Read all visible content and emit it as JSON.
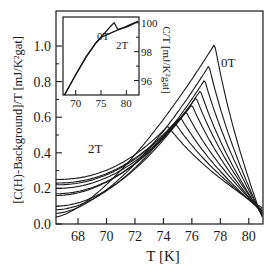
{
  "chart_data": [
    {
      "type": "line",
      "title": "",
      "xlabel": "T [K]",
      "ylabel": "[C(H)-Background]/T [mJ/K²gat]",
      "xlim": [
        66.45,
        81.0
      ],
      "ylim": [
        0.0,
        1.15
      ],
      "x_ticks": [
        68,
        70,
        72,
        74,
        76,
        78,
        80
      ],
      "y_ticks": [
        0.0,
        0.2,
        0.4,
        0.6,
        0.8,
        1.0
      ],
      "x_tick_labels": [
        "68",
        "70",
        "72",
        "74",
        "76",
        "78",
        "80"
      ],
      "y_tick_labels": [
        "0.0",
        "0.2",
        "0.4",
        "0.6",
        "0.8",
        "1.0"
      ],
      "grid": false,
      "legend": "none",
      "annotations": [
        {
          "text": "0T",
          "x": 78.2,
          "y": 0.9
        },
        {
          "text": "2T",
          "x": 68.8,
          "y": 0.42
        }
      ],
      "series": [
        {
          "name": "0T",
          "start": 0.04,
          "peak_T": 77.6,
          "peak": 1.01,
          "end": 0.03
        },
        {
          "name": "H2",
          "start": 0.06,
          "peak_T": 77.2,
          "peak": 0.89,
          "end": 0.04
        },
        {
          "name": "H3",
          "start": 0.08,
          "peak_T": 76.9,
          "peak": 0.81,
          "end": 0.05
        },
        {
          "name": "H4",
          "start": 0.1,
          "peak_T": 76.6,
          "peak": 0.75,
          "end": 0.05
        },
        {
          "name": "H5",
          "start": 0.16,
          "peak_T": 76.3,
          "peak": 0.71,
          "end": 0.06
        },
        {
          "name": "H6",
          "start": 0.17,
          "peak_T": 76.0,
          "peak": 0.67,
          "end": 0.06
        },
        {
          "name": "H7",
          "start": 0.2,
          "peak_T": 75.6,
          "peak": 0.63,
          "end": 0.07
        },
        {
          "name": "H8",
          "start": 0.22,
          "peak_T": 75.2,
          "peak": 0.6,
          "end": 0.07
        },
        {
          "name": "H9",
          "start": 0.23,
          "peak_T": 74.8,
          "peak": 0.57,
          "end": 0.08
        },
        {
          "name": "2T",
          "start": 0.25,
          "peak_T": 74.3,
          "peak": 0.55,
          "end": 0.09
        }
      ]
    },
    {
      "type": "line",
      "title": "inset",
      "xlabel": "",
      "ylabel": "C/T [mJ/K²gat]",
      "xlim": [
        67.5,
        82.5
      ],
      "ylim": [
        95.0,
        100.4
      ],
      "x_ticks": [
        70,
        75,
        80
      ],
      "y_ticks": [
        96,
        98,
        100
      ],
      "x_tick_labels": [
        "70",
        "75",
        "80"
      ],
      "y_tick_labels": [
        "96",
        "98",
        "100"
      ],
      "y_axis_side": "right",
      "grid": false,
      "annotations": [
        {
          "text": "0T",
          "x": 76.0,
          "y": 99.5
        },
        {
          "text": "2T",
          "x": 78.5,
          "y": 98.6
        }
      ],
      "series": [
        {
          "name": "0T",
          "x": [
            67.8,
            70,
            72,
            74,
            75,
            76,
            77,
            77.6,
            78.3,
            79,
            80,
            81,
            82.3
          ],
          "y": [
            95.0,
            96.4,
            97.6,
            98.6,
            99.0,
            99.4,
            99.8,
            100.0,
            99.55,
            99.6,
            99.7,
            99.85,
            100.1
          ]
        },
        {
          "name": "2T",
          "x": [
            67.8,
            70,
            72,
            74,
            75,
            76,
            77,
            78,
            79,
            80,
            81,
            82.3
          ],
          "y": [
            95.0,
            96.4,
            97.6,
            98.6,
            99.0,
            99.15,
            99.3,
            99.45,
            99.6,
            99.75,
            99.9,
            100.1
          ]
        }
      ]
    }
  ]
}
